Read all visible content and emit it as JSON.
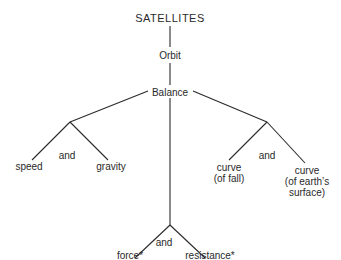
{
  "diagram": {
    "root": "SATELLITES",
    "level1": "Orbit",
    "level2": "Balance",
    "left": {
      "a": "speed",
      "join": "and",
      "b": "gravity"
    },
    "right": {
      "a_line1": "curve",
      "a_line2": "(of fall)",
      "join": "and",
      "b_line1": "curve",
      "b_line2": "(of earth’s",
      "b_line3": "surface)"
    },
    "center": {
      "a": "force*",
      "join": "and",
      "b": "resistance*"
    },
    "line_color": "#2a2a2a"
  }
}
